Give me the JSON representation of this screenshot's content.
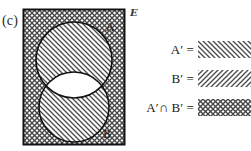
{
  "figure": {
    "part_label": "(c)",
    "universe_symbol": "E",
    "universe_symbol_name": "script-E-universal-set"
  },
  "venn": {
    "rectangle_label": "universal set rectangle",
    "outside_fill_pattern": "crosshatch",
    "set_a": {
      "label": "A",
      "fill_pattern": "diagonal-backslash",
      "position": "top-circle"
    },
    "set_b": {
      "label": "B",
      "fill_pattern": "diagonal-backslash",
      "position": "bottom-circle"
    },
    "intersection_fill": "white-unshaded"
  },
  "legend": {
    "items": [
      {
        "label": "A′ =",
        "name": "legend-a-complement",
        "pattern": "diagonal-backslash"
      },
      {
        "label": "B′ =",
        "name": "legend-b-complement",
        "pattern": "diagonal-slash"
      },
      {
        "label": "A′∩ B′ =",
        "name": "legend-a-complement-intersect-b-complement",
        "pattern": "crosshatch"
      }
    ]
  },
  "colors": {
    "ink": "#1a1a1a",
    "hatch": "#4a4a4a",
    "outline": "#111111",
    "paper": "#ffffff"
  }
}
